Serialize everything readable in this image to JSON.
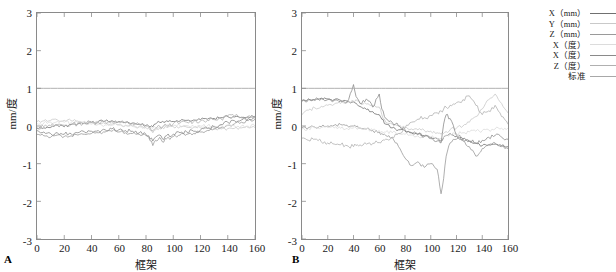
{
  "figure": {
    "panels": [
      {
        "letter": "A",
        "id": "panel-a"
      },
      {
        "letter": "B",
        "id": "panel-b"
      }
    ]
  },
  "legend": {
    "position": "right",
    "items": [
      {
        "label": "X（mm）",
        "color": "#707070"
      },
      {
        "label": "Y（mm）",
        "color": "#c9c9c9"
      },
      {
        "label": "Z（mm）",
        "color": "#9a9a9a"
      },
      {
        "label": "X（度）",
        "color": "#dcdcdc"
      },
      {
        "label": "X（度）",
        "color": "#8a8a8a"
      },
      {
        "label": "Z（度）",
        "color": "#b0b0b0"
      },
      {
        "label": "标准",
        "color": "#a8a8a8"
      }
    ]
  },
  "chart_data": [
    {
      "type": "line",
      "panel": "A",
      "title": "",
      "xlabel": "框架",
      "ylabel": "mm/度",
      "xlim": [
        0,
        160
      ],
      "ylim": [
        -3,
        3
      ],
      "xticks": [
        0,
        20,
        40,
        60,
        80,
        100,
        120,
        140,
        160
      ],
      "yticks": [
        3,
        2,
        1,
        0,
        -1,
        -2,
        -3
      ],
      "grid": false,
      "x": [
        0,
        5,
        10,
        15,
        20,
        25,
        30,
        35,
        40,
        45,
        50,
        55,
        60,
        65,
        70,
        75,
        80,
        82,
        85,
        87,
        90,
        92,
        95,
        100,
        105,
        110,
        115,
        120,
        125,
        130,
        135,
        140,
        145,
        150,
        155,
        160
      ],
      "series": [
        {
          "name": "X（mm）",
          "color": "#707070",
          "values": [
            -0.07,
            -0.05,
            -0.04,
            0.02,
            -0.02,
            0.04,
            0.06,
            0.08,
            0.1,
            0.12,
            0.13,
            0.14,
            0.12,
            0.1,
            0.08,
            0.05,
            0.02,
            0.0,
            -0.02,
            0.05,
            0.1,
            0.12,
            0.14,
            0.12,
            0.13,
            0.15,
            0.16,
            0.17,
            0.18,
            0.2,
            0.22,
            0.25,
            0.24,
            0.22,
            0.24,
            0.25
          ]
        },
        {
          "name": "Y（mm）",
          "color": "#c9c9c9",
          "values": [
            0.12,
            0.14,
            0.15,
            0.16,
            0.15,
            0.14,
            0.13,
            0.12,
            0.1,
            0.08,
            0.06,
            0.05,
            0.04,
            0.02,
            0.0,
            -0.02,
            -0.04,
            -0.05,
            -0.18,
            -0.1,
            -0.06,
            -0.04,
            -0.03,
            -0.02,
            -0.02,
            -0.03,
            -0.04,
            -0.05,
            -0.06,
            -0.07,
            -0.08,
            -0.07,
            -0.06,
            -0.05,
            -0.04,
            -0.04
          ]
        },
        {
          "name": "Z（mm）",
          "color": "#9a9a9a",
          "values": [
            -0.22,
            -0.26,
            -0.3,
            -0.24,
            -0.28,
            -0.26,
            -0.24,
            -0.22,
            -0.2,
            -0.18,
            -0.16,
            -0.14,
            -0.16,
            -0.18,
            -0.2,
            -0.22,
            -0.26,
            -0.3,
            -0.52,
            -0.38,
            -0.3,
            -0.42,
            -0.34,
            -0.28,
            -0.24,
            -0.22,
            -0.2,
            -0.16,
            -0.12,
            -0.08,
            -0.04,
            0.02,
            0.06,
            0.1,
            0.14,
            0.18
          ]
        },
        {
          "name": "X（度）",
          "color": "#dcdcdc",
          "values": [
            0.06,
            0.08,
            0.1,
            0.12,
            0.1,
            0.09,
            0.08,
            0.06,
            0.05,
            0.04,
            0.03,
            0.02,
            0.02,
            0.01,
            0.0,
            -0.01,
            -0.02,
            -0.03,
            -0.06,
            -0.04,
            -0.02,
            -0.01,
            0.0,
            0.0,
            0.01,
            0.01,
            0.0,
            0.0,
            0.0,
            0.0,
            0.01,
            0.01,
            0.0,
            0.0,
            0.0,
            0.0
          ]
        },
        {
          "name": "X（度）",
          "color": "#8a8a8a",
          "values": [
            -0.12,
            -0.16,
            -0.2,
            -0.18,
            -0.22,
            -0.2,
            -0.18,
            -0.16,
            -0.14,
            -0.12,
            -0.1,
            -0.08,
            -0.1,
            -0.12,
            -0.14,
            -0.18,
            -0.22,
            -0.26,
            -0.4,
            -0.3,
            -0.24,
            -0.34,
            -0.26,
            -0.22,
            -0.18,
            -0.16,
            -0.14,
            -0.1,
            -0.06,
            -0.02,
            0.04,
            0.1,
            0.14,
            0.16,
            0.2,
            0.22
          ]
        },
        {
          "name": "Z（度）",
          "color": "#b0b0b0",
          "values": [
            -0.04,
            -0.02,
            0.0,
            0.04,
            0.02,
            0.04,
            0.06,
            0.08,
            0.09,
            0.1,
            0.11,
            0.12,
            0.1,
            0.08,
            0.06,
            0.04,
            0.0,
            -0.04,
            -0.12,
            -0.06,
            0.0,
            -0.04,
            0.02,
            0.06,
            0.08,
            0.1,
            0.12,
            0.14,
            0.15,
            0.17,
            0.19,
            0.28,
            0.26,
            0.24,
            0.26,
            0.27
          ]
        },
        {
          "name": "标准",
          "color": "#a8a8a8",
          "constant": 1.0,
          "values": [
            1,
            1,
            1,
            1,
            1,
            1,
            1,
            1,
            1,
            1,
            1,
            1,
            1,
            1,
            1,
            1,
            1,
            1,
            1,
            1,
            1,
            1,
            1,
            1,
            1,
            1,
            1,
            1,
            1,
            1,
            1,
            1,
            1,
            1,
            1,
            1
          ]
        }
      ]
    },
    {
      "type": "line",
      "panel": "B",
      "title": "",
      "xlabel": "框架",
      "ylabel": "mm/度",
      "xlim": [
        0,
        160
      ],
      "ylim": [
        -3,
        3
      ],
      "xticks": [
        0,
        20,
        40,
        60,
        80,
        100,
        120,
        140,
        160
      ],
      "yticks": [
        3,
        2,
        1,
        0,
        -1,
        -2,
        -3
      ],
      "grid": false,
      "x": [
        0,
        5,
        10,
        15,
        20,
        25,
        30,
        35,
        40,
        42,
        45,
        50,
        55,
        60,
        62,
        65,
        70,
        75,
        80,
        85,
        90,
        95,
        100,
        105,
        108,
        110,
        112,
        115,
        120,
        125,
        130,
        135,
        140,
        145,
        150,
        155,
        160
      ],
      "series": [
        {
          "name": "X（mm）",
          "color": "#707070",
          "values": [
            0.68,
            0.72,
            0.7,
            0.74,
            0.72,
            0.7,
            0.68,
            0.66,
            0.64,
            0.6,
            0.52,
            0.44,
            0.38,
            0.3,
            0.18,
            0.05,
            -0.05,
            -0.1,
            -0.14,
            -0.18,
            -0.22,
            -0.26,
            -0.3,
            -0.34,
            -0.4,
            -0.3,
            -0.25,
            -0.2,
            -0.28,
            -0.34,
            -0.4,
            -0.46,
            -0.52,
            -0.5,
            -0.48,
            -0.52,
            -0.55
          ]
        },
        {
          "name": "Y（mm）",
          "color": "#c9c9c9",
          "values": [
            0.3,
            0.42,
            0.48,
            0.52,
            0.55,
            0.58,
            0.6,
            0.62,
            0.66,
            0.7,
            0.62,
            0.58,
            0.55,
            0.5,
            0.3,
            0.1,
            0.05,
            0.0,
            -0.05,
            -0.08,
            -0.1,
            -0.12,
            -0.14,
            -0.18,
            -0.22,
            -0.2,
            -0.15,
            -0.1,
            -0.05,
            0.0,
            0.1,
            0.25,
            0.45,
            0.7,
            0.85,
            0.6,
            0.35
          ]
        },
        {
          "name": "Z（mm）",
          "color": "#9a9a9a",
          "values": [
            -0.05,
            -0.04,
            -0.03,
            -0.02,
            0.0,
            0.02,
            0.04,
            0.02,
            0.0,
            -0.02,
            -0.05,
            -0.08,
            -0.12,
            -0.16,
            -0.2,
            -0.25,
            -0.3,
            -0.55,
            -0.85,
            -1.05,
            -0.95,
            -1.1,
            -1.0,
            -1.15,
            -1.8,
            -1.4,
            -0.8,
            -0.45,
            -0.35,
            -0.4,
            -0.55,
            -0.8,
            -0.6,
            -0.5,
            -0.45,
            -0.55,
            -0.6
          ]
        },
        {
          "name": "X（度）",
          "color": "#dcdcdc",
          "values": [
            -0.08,
            -0.06,
            -0.05,
            -0.04,
            -0.04,
            -0.05,
            -0.06,
            -0.06,
            -0.05,
            -0.05,
            -0.06,
            -0.08,
            -0.1,
            -0.12,
            -0.14,
            -0.16,
            -0.18,
            -0.2,
            -0.22,
            -0.24,
            -0.26,
            -0.28,
            -0.3,
            -0.32,
            -0.34,
            -0.3,
            -0.26,
            -0.22,
            -0.2,
            -0.18,
            -0.16,
            -0.14,
            -0.12,
            -0.1,
            -0.08,
            -0.06,
            -0.05
          ]
        },
        {
          "name": "X（度）",
          "color": "#8a8a8a",
          "values": [
            0.65,
            0.7,
            0.68,
            0.72,
            0.7,
            0.68,
            0.66,
            0.64,
            1.1,
            0.78,
            0.6,
            0.72,
            0.5,
            0.85,
            0.45,
            0.2,
            0.1,
            0.0,
            -0.1,
            -0.18,
            -0.22,
            -0.28,
            -0.34,
            -0.4,
            -0.45,
            0.05,
            0.3,
            0.2,
            -0.25,
            -0.35,
            -0.4,
            -0.45,
            -0.38,
            -0.3,
            -0.25,
            -0.3,
            -0.35
          ]
        },
        {
          "name": "Z（度）",
          "color": "#b0b0b0",
          "values": [
            -0.32,
            -0.38,
            -0.35,
            -0.42,
            -0.45,
            -0.48,
            -0.5,
            -0.52,
            -0.55,
            -0.52,
            -0.5,
            -0.48,
            -0.46,
            -0.44,
            -0.4,
            -0.35,
            -0.3,
            -0.2,
            -0.05,
            0.1,
            0.18,
            0.22,
            0.28,
            0.35,
            0.4,
            0.45,
            0.5,
            0.55,
            0.62,
            0.7,
            0.8,
            0.55,
            0.3,
            0.4,
            0.55,
            0.25,
            0.05
          ]
        },
        {
          "name": "标准",
          "color": "#a8a8a8",
          "constant": 1.0,
          "values": [
            1,
            1,
            1,
            1,
            1,
            1,
            1,
            1,
            1,
            1,
            1,
            1,
            1,
            1,
            1,
            1,
            1,
            1,
            1,
            1,
            1,
            1,
            1,
            1,
            1,
            1,
            1,
            1,
            1,
            1,
            1,
            1,
            1,
            1,
            1,
            1,
            1
          ]
        }
      ]
    }
  ]
}
